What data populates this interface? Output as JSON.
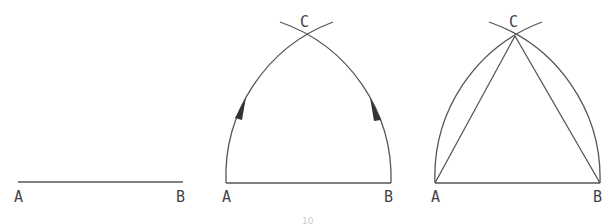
{
  "figures": [
    {
      "id": "step1",
      "description": "Line segment AB",
      "labels": {
        "a": "A",
        "b": "B"
      }
    },
    {
      "id": "step2",
      "description": "Arcs with radius AB drawn from A and B, intersecting at C",
      "labels": {
        "a": "A",
        "b": "B",
        "c": "C"
      }
    },
    {
      "id": "step3",
      "description": "Equilateral triangle ABC formed by joining C to A and B",
      "labels": {
        "a": "A",
        "b": "B",
        "c": "C"
      }
    }
  ],
  "caption": "10",
  "colors": {
    "line": "#555555",
    "text": "#444444",
    "arrow": "#333333"
  }
}
